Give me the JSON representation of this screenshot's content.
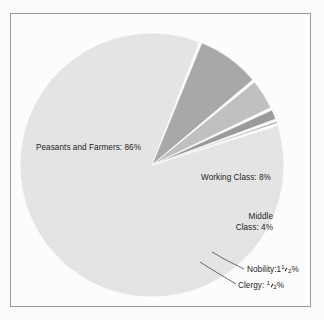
{
  "figure": {
    "background_color": "#fbfbfb",
    "frame_color": "#9a9a9a",
    "text_color": "#1d1d1d"
  },
  "labels": {
    "peasants": "Peasants and Farmers:  86%",
    "working": "Working Class: 8%",
    "middle_line1": "Middle",
    "middle_line2": "Class: 4%",
    "nobility_prefix": "Nobility:1",
    "nobility_num": "1",
    "nobility_den": "2",
    "nobility_suffix": "%",
    "clergy_prefix": "Clergy: ",
    "clergy_num": "1",
    "clergy_den": "2",
    "clergy_suffix": "%"
  },
  "chart_data": {
    "type": "pie",
    "title": "",
    "subtitle": "",
    "xlabel": "",
    "ylabel": "",
    "grid": false,
    "legend_position": "none",
    "label_mode": "inside-slice-and-leader-lines",
    "total_percent": 100,
    "start_angle_deg": -18,
    "direction": "clockwise",
    "center": {
      "x": 152,
      "y": 165
    },
    "radius": 132,
    "slice_gap_deg": 1.2,
    "categories": [
      "Peasants and Farmers",
      "Working Class",
      "Middle Class",
      "Nobility",
      "Clergy"
    ],
    "values": [
      86,
      8,
      4,
      1.5,
      0.5
    ],
    "value_labels": [
      "86%",
      "8%",
      "4%",
      "1 1/2%",
      "1/2%"
    ],
    "colors": [
      "#e4e4e4",
      "#a8a8a8",
      "#c0c0c0",
      "#9a9a9a",
      "#787878"
    ],
    "slices": [
      {
        "name": "Peasants and Farmers",
        "value": 86,
        "label": "Peasants and Farmers:  86%",
        "color": "#e4e4e4",
        "label_placement": "inside"
      },
      {
        "name": "Working Class",
        "value": 8,
        "label": "Working Class: 8%",
        "color": "#a8a8a8",
        "label_placement": "inside"
      },
      {
        "name": "Middle Class",
        "value": 4,
        "label": "Middle Class: 4%",
        "color": "#c0c0c0",
        "label_placement": "inside"
      },
      {
        "name": "Nobility",
        "value": 1.5,
        "label": "Nobility: 1 1/2%",
        "color": "#9a9a9a",
        "label_placement": "leader-line"
      },
      {
        "name": "Clergy",
        "value": 0.5,
        "label": "Clergy: 1/2%",
        "color": "#787878",
        "label_placement": "leader-line"
      }
    ]
  }
}
